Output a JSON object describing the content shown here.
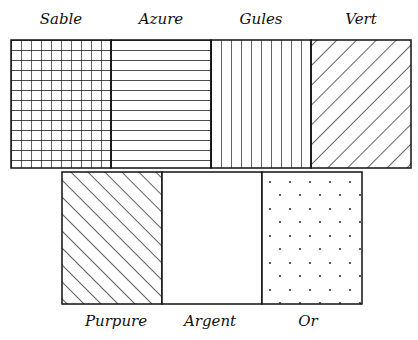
{
  "top_row": [
    {
      "name": "Sable",
      "pattern": "grid"
    },
    {
      "name": "Azure",
      "pattern": "horizontal"
    },
    {
      "name": "Gules",
      "pattern": "vertical"
    },
    {
      "name": "Vert",
      "pattern": "diagonal-down"
    }
  ],
  "bottom_row": [
    {
      "name": "Purpure",
      "pattern": "diagonal-up"
    },
    {
      "name": "Argent",
      "pattern": "plain"
    },
    {
      "name": "Or",
      "pattern": "dots"
    }
  ],
  "colors": {
    "line": "#111111",
    "background": "#ffffff"
  }
}
